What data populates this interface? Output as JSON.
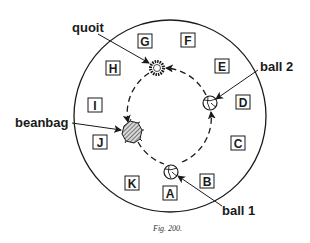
{
  "figure": {
    "caption": "Fig. 200.",
    "outer_circle": {
      "cx": 170,
      "cy": 116,
      "r": 96
    },
    "path_circle": {
      "cx": 169,
      "cy": 116,
      "r": 48,
      "style": "dashed"
    },
    "stations": [
      {
        "letter": "A",
        "x": 170,
        "y": 193
      },
      {
        "letter": "B",
        "x": 207,
        "y": 181
      },
      {
        "letter": "C",
        "x": 238,
        "y": 143
      },
      {
        "letter": "D",
        "x": 243,
        "y": 102
      },
      {
        "letter": "E",
        "x": 222,
        "y": 66
      },
      {
        "letter": "F",
        "x": 188,
        "y": 40
      },
      {
        "letter": "G",
        "x": 145,
        "y": 41
      },
      {
        "letter": "H",
        "x": 113,
        "y": 68
      },
      {
        "letter": "I",
        "x": 95,
        "y": 105
      },
      {
        "letter": "J",
        "x": 100,
        "y": 142
      },
      {
        "letter": "K",
        "x": 132,
        "y": 183
      }
    ],
    "objects": {
      "quoit": {
        "label": "quoit",
        "x": 157,
        "y": 68
      },
      "ball2": {
        "label": "ball 2",
        "x": 210,
        "y": 103
      },
      "beanbag": {
        "label": "beanbag",
        "x": 132,
        "y": 132
      },
      "ball1": {
        "label": "ball 1",
        "x": 171,
        "y": 172
      }
    },
    "colors": {
      "ink": "#1a1a1a",
      "paper": "#ffffff"
    }
  }
}
